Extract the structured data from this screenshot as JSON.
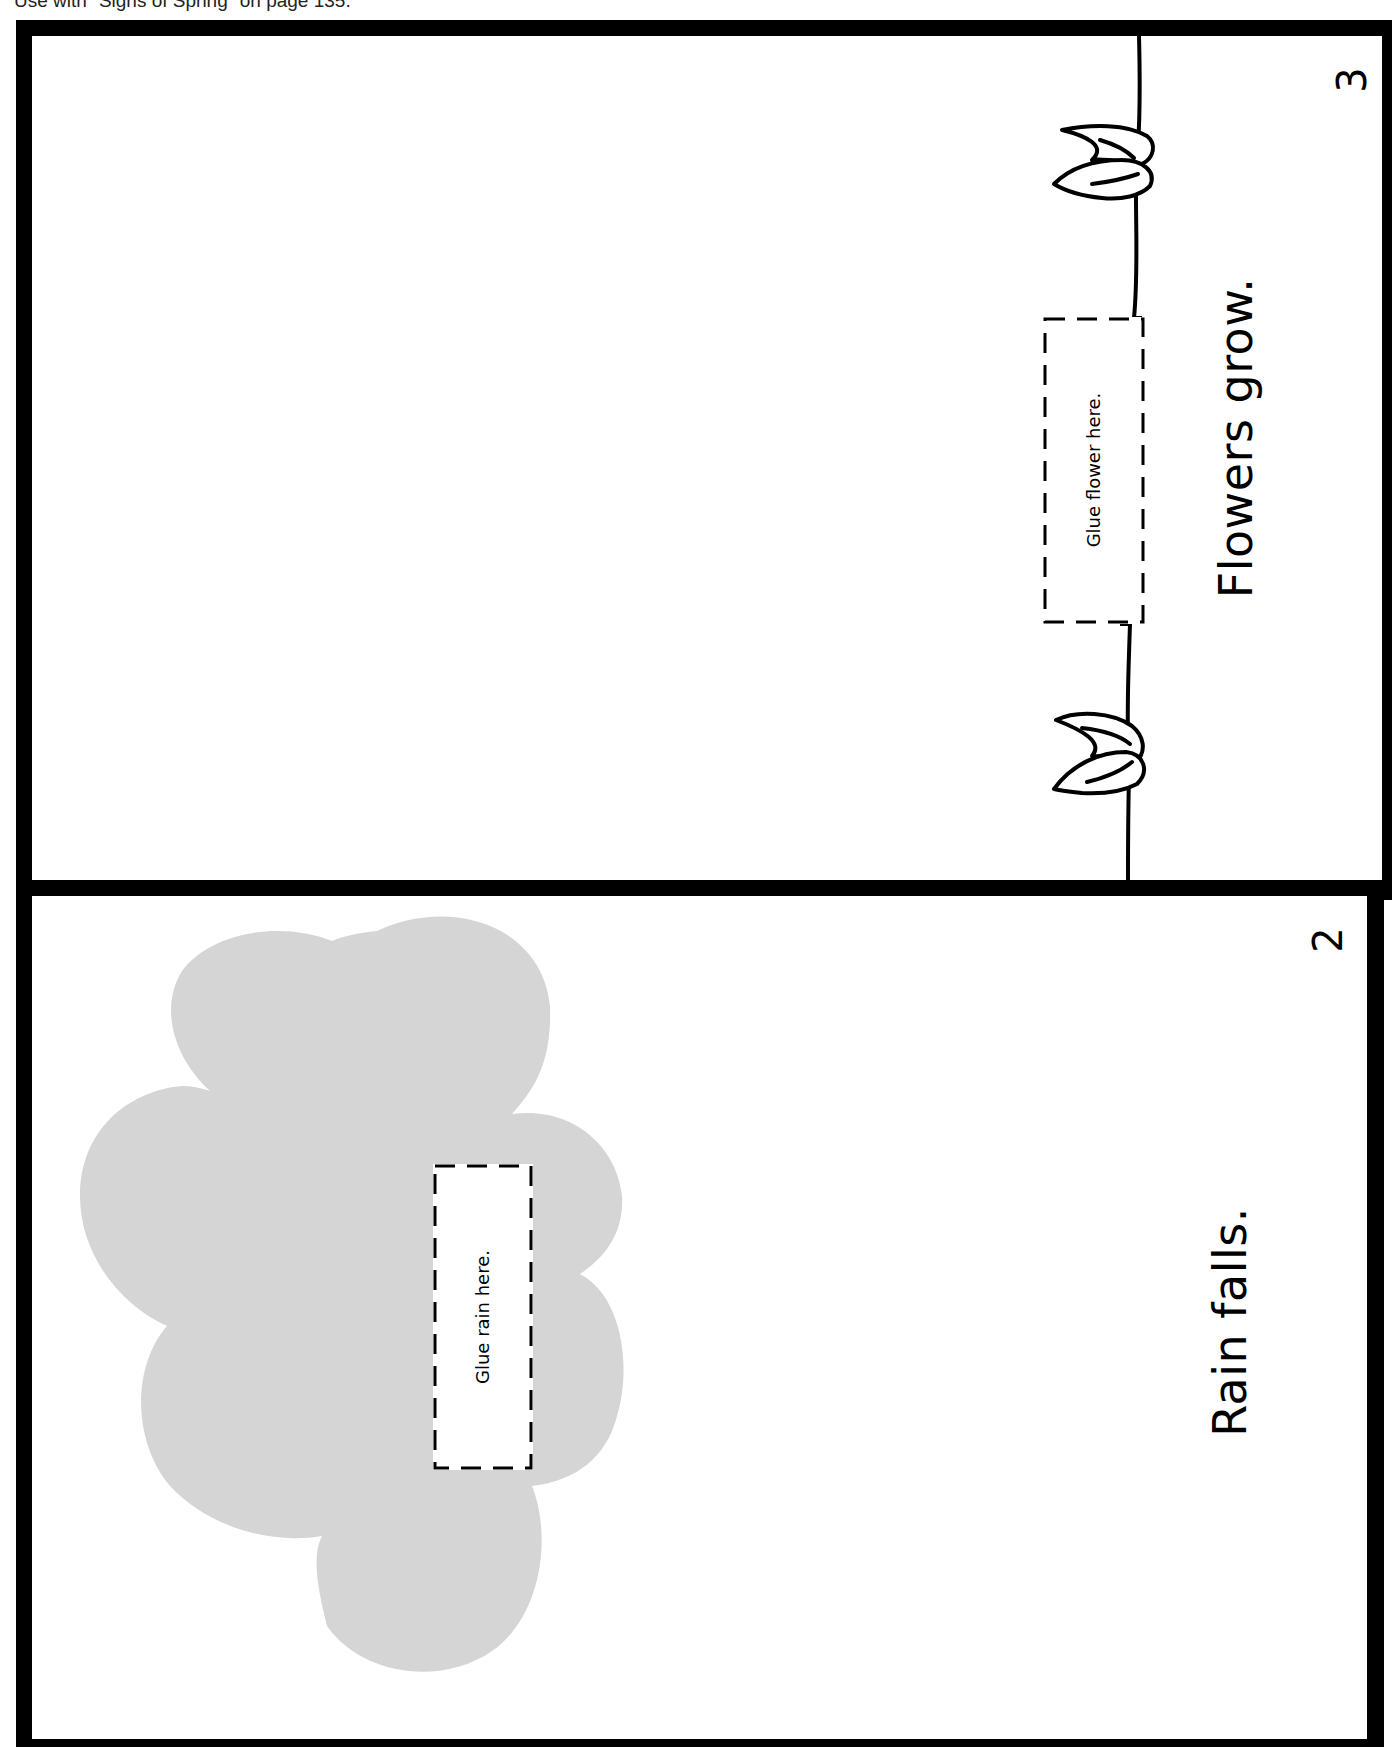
{
  "header": {
    "note": "Use with \"Signs of Spring\" on page 135."
  },
  "colors": {
    "frame": "#000000",
    "cloud": "#d5d5d5",
    "paper": "#ffffff"
  },
  "pages": [
    {
      "page_number": "3",
      "caption": "Flowers grow.",
      "glue_label": "Glue flower here.",
      "illustration": [
        "ground-line",
        "sprout",
        "sprout"
      ]
    },
    {
      "page_number": "2",
      "caption": "Rain falls.",
      "glue_label": "Glue rain here.",
      "illustration": [
        "cloud"
      ]
    }
  ]
}
